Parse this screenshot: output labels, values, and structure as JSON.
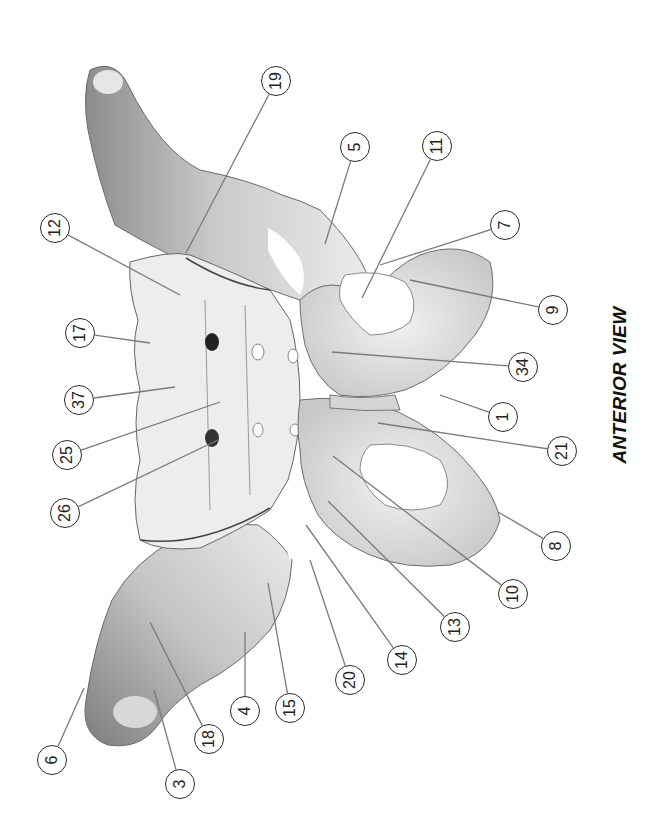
{
  "figure": {
    "caption": "ANTERIOR VIEW",
    "orientation": "rotated 90 degrees counter-clockwise",
    "colors": {
      "background": "#ffffff",
      "bone_light": "#eeeeee",
      "bone_shade": "#9a9a9a",
      "label_stroke": "#2a2a2a",
      "leader_line": "#777777"
    }
  },
  "callouts": [
    {
      "label": "19",
      "x": 276,
      "y": 81,
      "tx": 186,
      "ty": 253
    },
    {
      "label": "12",
      "x": 55,
      "y": 228,
      "tx": 180,
      "ty": 295
    },
    {
      "label": "5",
      "x": 355,
      "y": 147,
      "tx": 325,
      "ty": 244
    },
    {
      "label": "11",
      "x": 437,
      "y": 146,
      "tx": 362,
      "ty": 298
    },
    {
      "label": "7",
      "x": 505,
      "y": 225,
      "tx": 380,
      "ty": 265
    },
    {
      "label": "9",
      "x": 553,
      "y": 310,
      "tx": 410,
      "ty": 280
    },
    {
      "label": "17",
      "x": 80,
      "y": 333,
      "tx": 150,
      "ty": 343
    },
    {
      "label": "37",
      "x": 79,
      "y": 400,
      "tx": 175,
      "ty": 387
    },
    {
      "label": "34",
      "x": 523,
      "y": 367,
      "tx": 332,
      "ty": 352
    },
    {
      "label": "25",
      "x": 67,
      "y": 455,
      "tx": 220,
      "ty": 402
    },
    {
      "label": "1",
      "x": 503,
      "y": 417,
      "tx": 440,
      "ty": 395
    },
    {
      "label": "26",
      "x": 65,
      "y": 513,
      "tx": 218,
      "ty": 440
    },
    {
      "label": "21",
      "x": 562,
      "y": 451,
      "tx": 378,
      "ty": 423
    },
    {
      "label": "8",
      "x": 556,
      "y": 546,
      "tx": 498,
      "ty": 512
    },
    {
      "label": "10",
      "x": 513,
      "y": 594,
      "tx": 333,
      "ty": 456
    },
    {
      "label": "13",
      "x": 455,
      "y": 627,
      "tx": 328,
      "ty": 501
    },
    {
      "label": "14",
      "x": 402,
      "y": 660,
      "tx": 306,
      "ty": 525
    },
    {
      "label": "20",
      "x": 350,
      "y": 680,
      "tx": 310,
      "ty": 560
    },
    {
      "label": "15",
      "x": 290,
      "y": 708,
      "tx": 268,
      "ty": 583
    },
    {
      "label": "4",
      "x": 245,
      "y": 711,
      "tx": 245,
      "ty": 632
    },
    {
      "label": "18",
      "x": 209,
      "y": 739,
      "tx": 150,
      "ty": 622
    },
    {
      "label": "6",
      "x": 52,
      "y": 760,
      "tx": 84,
      "ty": 688
    },
    {
      "label": "3",
      "x": 180,
      "y": 784,
      "tx": 154,
      "ty": 690
    }
  ]
}
